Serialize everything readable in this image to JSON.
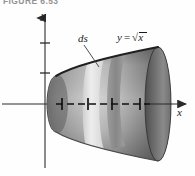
{
  "figure": {
    "caption": "FIGURE 6.53",
    "background_color": "#fefefe",
    "width": 195,
    "height": 176
  },
  "axes": {
    "x_label": "x",
    "y_label": "y",
    "origin": {
      "x": 45,
      "y": 104
    },
    "x_axis": {
      "start_x": 2,
      "end_x": 186,
      "y": 104,
      "arrow": "right"
    },
    "y_axis": {
      "x": 45,
      "start_y": 168,
      "end_y": 14,
      "arrow": "up"
    },
    "y_ticks": [
      {
        "y": 43,
        "half_width": 5
      },
      {
        "y": 73,
        "half_width": 5
      }
    ],
    "x_ticks": [
      {
        "x": 62,
        "half_height": 6
      },
      {
        "x": 88,
        "half_height": 6
      },
      {
        "x": 112,
        "half_height": 6
      },
      {
        "x": 140,
        "half_height": 6
      }
    ],
    "axis_color": "#2b2b2b",
    "dashed_segment": {
      "from_x": 58,
      "to_x": 150,
      "y": 104
    }
  },
  "labels": {
    "ds": "ds",
    "curve_y": "y",
    "curve_equals": "=",
    "curve_radical": "√",
    "curve_arg": "x",
    "curve_full": "y = √x"
  },
  "solid": {
    "description": "solid of revolution, horn shape, y = sqrt(x) revolved about x-axis",
    "left_cap_x": 56,
    "right_cap_x": 158,
    "left_radius_y": 28,
    "right_radius_y": 57,
    "fill_dark": "#6e6e6e",
    "fill_mid": "#9a9a9a",
    "fill_light": "#dcdcdc",
    "edge_color": "#2a2a2a",
    "highlight_band": {
      "label": "ds",
      "left_x": 88,
      "right_x": 104,
      "fill": "#e8e8e8"
    },
    "secondary_band": {
      "left_x": 112,
      "right_x": 124,
      "fill": "#8d8d8d"
    }
  },
  "leader_line": {
    "name": "ds-leader",
    "from": {
      "x": 84,
      "y": 45
    },
    "to": {
      "x": 99,
      "y": 66
    },
    "color": "#3a3a3a"
  }
}
